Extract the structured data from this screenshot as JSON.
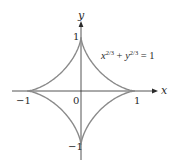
{
  "diagram": {
    "equation": {
      "x_var": "x",
      "x_exp": "2/3",
      "plus": " + ",
      "y_var": "y",
      "y_exp": "2/3",
      "equals": " = 1"
    },
    "axes": {
      "x_label": "x",
      "y_label": "y"
    },
    "ticks": {
      "x_neg": "−1",
      "origin": "0",
      "x_pos": "1",
      "y_pos": "1",
      "y_neg": "−1"
    },
    "colors": {
      "curve": "#8a8a8a",
      "axis": "#2a2a2a",
      "text": "#2a2a2a"
    },
    "geometry": {
      "origin_px": [
        81,
        91
      ],
      "unit_px": 54
    }
  }
}
